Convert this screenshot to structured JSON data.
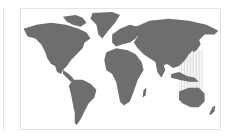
{
  "map": {
    "type": "world-map",
    "projection": "equirectangular-like",
    "land_color": "#6e6e6e",
    "ocean_color": "#ffffff",
    "frame_color": "#e3e3e3",
    "highlight": {
      "region": "East Asia / Western Pacific",
      "style": "vertical-stripes",
      "color": "#d8d8d8"
    }
  }
}
